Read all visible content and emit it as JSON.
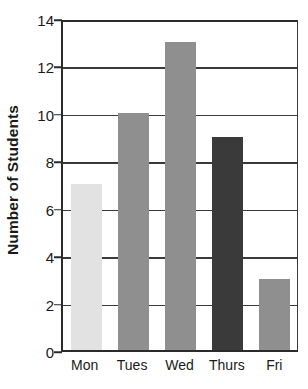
{
  "chart_data": {
    "type": "bar",
    "title": "",
    "subtitle": "",
    "xlabel": "",
    "ylabel": "Number of Students",
    "categories": [
      "Mon",
      "Tues",
      "Wed",
      "Thurs",
      "Fri"
    ],
    "values": [
      7,
      10,
      13,
      9,
      3
    ],
    "series": [
      {
        "name": "Number of Students",
        "values": [
          7,
          10,
          13,
          9,
          3
        ]
      }
    ],
    "bar_colors": [
      "#e2e2e2",
      "#8f8f8f",
      "#8f8f8f",
      "#3a3a3a",
      "#8f8f8f"
    ],
    "ylim": [
      0,
      14
    ],
    "ytick_values": [
      0,
      2,
      4,
      6,
      8,
      10,
      12,
      14
    ],
    "ytick_labels": [
      "0",
      "2",
      "4",
      "6",
      "8",
      "10",
      "12",
      "14"
    ],
    "ytick_step": 2,
    "xtick_labels": [
      "Mon",
      "Tues",
      "Wed",
      "Thurs",
      "Fri"
    ],
    "grid": true,
    "grid_orientation": "horizontal",
    "legend": false,
    "legend_position": "none",
    "annotations": [],
    "data_labels": false,
    "axis_color": "#2b2b2b",
    "grid_color": "#3a3a3a",
    "background_color": "#ffffff"
  },
  "axes": {
    "y_title": "Number of Students"
  }
}
